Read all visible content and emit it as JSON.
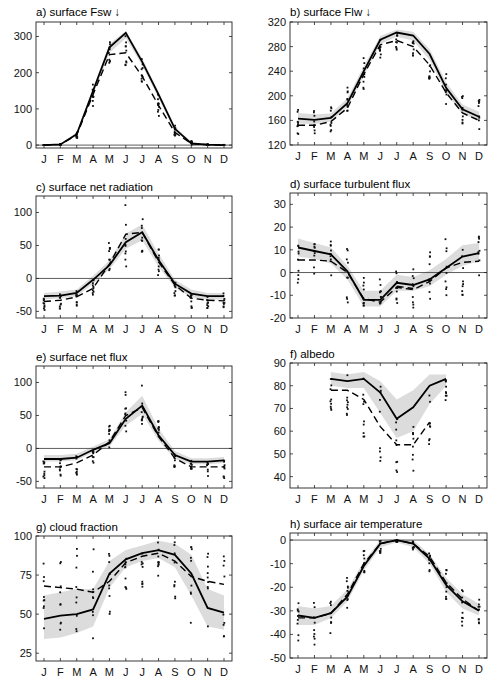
{
  "months": [
    "J",
    "F",
    "M",
    "A",
    "M",
    "J",
    "J",
    "A",
    "S",
    "O",
    "N",
    "D"
  ],
  "chart_data": [
    {
      "id": "a",
      "type": "line",
      "title": "a) surface Fsw ↓",
      "frame": [
        36,
        22,
        232,
        148
      ],
      "ylim": [
        -8,
        340
      ],
      "yticks": [
        0,
        100,
        200,
        300
      ],
      "zero_line": false,
      "series": [
        {
          "name": "solid",
          "style": "solid",
          "values": [
            0,
            2,
            30,
            150,
            270,
            310,
            230,
            140,
            45,
            5,
            1,
            0
          ]
        },
        {
          "name": "dashed",
          "style": "dashed",
          "values": [
            0,
            2,
            28,
            140,
            250,
            255,
            190,
            110,
            35,
            4,
            1,
            0
          ]
        }
      ],
      "band": {
        "lower": [
          0,
          1,
          25,
          140,
          255,
          295,
          220,
          130,
          38,
          3,
          0,
          0
        ],
        "upper": [
          1,
          4,
          35,
          158,
          280,
          315,
          240,
          148,
          52,
          8,
          2,
          1
        ]
      },
      "scatter_spread": [
        [
          0,
          0
        ],
        [
          0,
          3
        ],
        [
          18,
          40
        ],
        [
          105,
          170
        ],
        [
          210,
          290
        ],
        [
          220,
          310
        ],
        [
          170,
          250
        ],
        [
          80,
          155
        ],
        [
          25,
          65
        ],
        [
          0,
          12
        ],
        [
          0,
          2
        ],
        [
          0,
          1
        ]
      ]
    },
    {
      "id": "b",
      "type": "line",
      "title": "b) surface Flw ↓",
      "frame": [
        290,
        22,
        487,
        145
      ],
      "ylim": [
        120,
        320
      ],
      "yticks": [
        120,
        160,
        200,
        240,
        280,
        320
      ],
      "zero_line": false,
      "series": [
        {
          "name": "solid",
          "style": "solid",
          "values": [
            163,
            161,
            164,
            188,
            240,
            291,
            303,
            298,
            268,
            213,
            178,
            166
          ]
        },
        {
          "name": "dashed",
          "style": "dashed",
          "values": [
            152,
            152,
            158,
            180,
            235,
            283,
            290,
            280,
            250,
            205,
            172,
            160
          ]
        }
      ],
      "band": {
        "lower": [
          155,
          154,
          158,
          182,
          232,
          284,
          296,
          290,
          258,
          205,
          170,
          160
        ],
        "upper": [
          172,
          170,
          171,
          196,
          248,
          297,
          308,
          304,
          276,
          222,
          186,
          174
        ]
      },
      "scatter_spread": [
        [
          135,
          182
        ],
        [
          133,
          180
        ],
        [
          138,
          185
        ],
        [
          170,
          215
        ],
        [
          208,
          268
        ],
        [
          250,
          300
        ],
        [
          275,
          302
        ],
        [
          265,
          300
        ],
        [
          225,
          272
        ],
        [
          180,
          242
        ],
        [
          155,
          212
        ],
        [
          145,
          195
        ]
      ]
    },
    {
      "id": "c",
      "type": "line",
      "title": "c) surface net radiation",
      "frame": [
        36,
        196,
        232,
        318
      ],
      "ylim": [
        -60,
        125
      ],
      "yticks": [
        -50,
        0,
        50,
        100
      ],
      "zero_line": true,
      "series": [
        {
          "name": "solid",
          "style": "solid",
          "values": [
            -27,
            -26,
            -22,
            -2,
            20,
            55,
            70,
            28,
            -8,
            -23,
            -27,
            -27
          ]
        },
        {
          "name": "dashed",
          "style": "dashed",
          "values": [
            -35,
            -33,
            -28,
            -15,
            22,
            67,
            70,
            25,
            -10,
            -30,
            -33,
            -34
          ]
        }
      ],
      "band": {
        "lower": [
          -32,
          -30,
          -27,
          -8,
          14,
          45,
          58,
          18,
          -14,
          -29,
          -32,
          -32
        ],
        "upper": [
          -22,
          -20,
          -17,
          4,
          27,
          68,
          82,
          38,
          -2,
          -17,
          -22,
          -22
        ]
      },
      "scatter_spread": [
        [
          -48,
          -20
        ],
        [
          -46,
          -20
        ],
        [
          -42,
          -18
        ],
        [
          -28,
          -2
        ],
        [
          -8,
          57
        ],
        [
          14,
          112
        ],
        [
          36,
          100
        ],
        [
          2,
          48
        ],
        [
          -28,
          -6
        ],
        [
          -48,
          -20
        ],
        [
          -48,
          -22
        ],
        [
          -48,
          -22
        ]
      ]
    },
    {
      "id": "d",
      "type": "line",
      "title": "d) surface turbulent flux",
      "frame": [
        290,
        193,
        487,
        318
      ],
      "ylim": [
        -20,
        35
      ],
      "yticks": [
        -20,
        -10,
        0,
        10,
        20,
        30
      ],
      "zero_line": true,
      "series": [
        {
          "name": "solid",
          "style": "solid",
          "values": [
            11,
            9.5,
            8,
            0.5,
            -12,
            -12,
            -4.5,
            -5.5,
            -3,
            2,
            7,
            8.5
          ]
        },
        {
          "name": "dashed",
          "style": "dashed",
          "values": [
            5.5,
            5.5,
            5,
            0,
            -11.5,
            -13,
            -6.5,
            -7.5,
            -4,
            2,
            4.5,
            5
          ]
        },
        {
          "name": "dashed2",
          "style": "dashed",
          "values": [
            null,
            null,
            null,
            null,
            null,
            null,
            -6,
            -7,
            null,
            null,
            null,
            null
          ]
        }
      ],
      "band": {
        "lower": [
          7,
          6,
          4,
          -3,
          -15,
          -15,
          -8,
          -8,
          -6,
          -1,
          3,
          5
        ],
        "upper": [
          15,
          13,
          11,
          3,
          -8,
          -8,
          -1,
          -2,
          1,
          6,
          12,
          13
        ]
      },
      "scatter_spread": [
        [
          -5,
          16
        ],
        [
          -3,
          15
        ],
        [
          -3,
          15
        ],
        [
          -14,
          11
        ],
        [
          -20,
          3
        ],
        [
          -14,
          -2
        ],
        [
          -15,
          1
        ],
        [
          -16,
          5
        ],
        [
          -14,
          10
        ],
        [
          -14,
          15
        ],
        [
          -10,
          16
        ],
        [
          -7,
          16
        ]
      ]
    },
    {
      "id": "e",
      "type": "line",
      "title": "e) surface net flux",
      "frame": [
        36,
        366,
        232,
        488
      ],
      "ylim": [
        -60,
        125
      ],
      "yticks": [
        -50,
        0,
        50,
        100
      ],
      "zero_line": true,
      "series": [
        {
          "name": "solid",
          "style": "solid",
          "values": [
            -16,
            -16,
            -14,
            -2,
            8,
            45,
            65,
            20,
            -10,
            -20,
            -20,
            -18
          ]
        },
        {
          "name": "dashed",
          "style": "dashed",
          "values": [
            -28,
            -28,
            -22,
            -10,
            10,
            50,
            62,
            18,
            -15,
            -28,
            -28,
            -28
          ]
        }
      ],
      "band": {
        "lower": [
          -20,
          -20,
          -18,
          -6,
          3,
          35,
          52,
          12,
          -16,
          -24,
          -24,
          -22
        ],
        "upper": [
          -10,
          -10,
          -8,
          3,
          14,
          55,
          80,
          30,
          -4,
          -15,
          -15,
          -13
        ]
      },
      "scatter_spread": [
        [
          -46,
          -15
        ],
        [
          -44,
          -15
        ],
        [
          -40,
          -10
        ],
        [
          -22,
          -4
        ],
        [
          -4,
          37
        ],
        [
          12,
          94
        ],
        [
          36,
          97
        ],
        [
          8,
          42
        ],
        [
          -30,
          -6
        ],
        [
          -42,
          -18
        ],
        [
          -44,
          -18
        ],
        [
          -46,
          -18
        ]
      ]
    },
    {
      "id": "f",
      "type": "line",
      "title": "f) albedo",
      "frame": [
        290,
        363,
        487,
        488
      ],
      "ylim": [
        35,
        90
      ],
      "yticks": [
        40,
        50,
        60,
        70,
        80,
        90
      ],
      "zero_line": false,
      "series": [
        {
          "name": "solid",
          "style": "solid",
          "values": [
            null,
            null,
            83,
            82,
            83,
            77,
            65.5,
            70.5,
            80,
            83,
            null,
            null
          ]
        },
        {
          "name": "dashed",
          "style": "dashed",
          "values": [
            null,
            null,
            78,
            78,
            74,
            62,
            54,
            54,
            64,
            null,
            null,
            null
          ]
        }
      ],
      "band": {
        "lower": [
          null,
          null,
          80,
          79,
          79,
          68,
          57,
          60,
          72,
          80,
          null,
          null
        ],
        "upper": [
          null,
          null,
          86,
          85,
          86,
          82,
          74,
          78,
          85,
          85,
          null,
          null
        ]
      },
      "scatter_spread": [
        [
          null,
          null
        ],
        [
          null,
          null
        ],
        [
          69,
          85
        ],
        [
          67,
          85
        ],
        [
          56,
          84
        ],
        [
          46,
          80
        ],
        [
          42,
          66
        ],
        [
          41,
          66
        ],
        [
          54,
          76
        ],
        [
          73,
          83
        ],
        [
          null,
          null
        ],
        [
          null,
          null
        ]
      ]
    },
    {
      "id": "g",
      "type": "line",
      "title": "g) cloud fraction",
      "frame": [
        36,
        536,
        232,
        661
      ],
      "ylim": [
        20,
        100
      ],
      "yticks": [
        25,
        50,
        75,
        100
      ],
      "zero_line": false,
      "series": [
        {
          "name": "solid",
          "style": "solid",
          "values": [
            47,
            49,
            50,
            53,
            76,
            85,
            89,
            91,
            88,
            76,
            54,
            51
          ]
        },
        {
          "name": "dashed",
          "style": "dashed",
          "values": [
            68,
            67,
            66,
            64,
            71,
            83,
            87,
            89,
            84,
            74,
            71,
            69
          ]
        }
      ],
      "band": {
        "lower": [
          34,
          35,
          38,
          42,
          67,
          80,
          84,
          86,
          80,
          62,
          42,
          40
        ],
        "upper": [
          62,
          64,
          66,
          66,
          84,
          91,
          94,
          97,
          95,
          88,
          66,
          62
        ]
      },
      "scatter_spread": [
        [
          34,
          94
        ],
        [
          35,
          94
        ],
        [
          32,
          93
        ],
        [
          27,
          92
        ],
        [
          45,
          89
        ],
        [
          62,
          95
        ],
        [
          66,
          93
        ],
        [
          71,
          96
        ],
        [
          59,
          97
        ],
        [
          42,
          95
        ],
        [
          35,
          94
        ],
        [
          33,
          95
        ]
      ]
    },
    {
      "id": "h",
      "type": "line",
      "title": "h) surface air temperature",
      "frame": [
        290,
        533,
        487,
        658
      ],
      "ylim": [
        -50,
        3
      ],
      "yticks": [
        -50,
        -40,
        -30,
        -20,
        -10,
        0
      ],
      "zero_line": true,
      "series": [
        {
          "name": "solid",
          "style": "solid",
          "values": [
            -32,
            -33,
            -31,
            -24,
            -11,
            -1.5,
            0,
            -1.5,
            -8,
            -19,
            -26,
            -30
          ]
        },
        {
          "name": "dashed",
          "style": "dashed",
          "values": [
            -33,
            -33,
            -31,
            -23,
            -10,
            -1.5,
            0,
            -1.5,
            -7,
            -18,
            -25,
            -30
          ]
        }
      ],
      "band": {
        "lower": [
          -36,
          -36,
          -33,
          -26,
          -13,
          -3,
          -1,
          -3,
          -10,
          -22,
          -29,
          -32
        ],
        "upper": [
          -28,
          -29,
          -28,
          -21,
          -9,
          0,
          0.5,
          0,
          -6,
          -16,
          -23,
          -27
        ]
      },
      "scatter_spread": [
        [
          -45,
          -25
        ],
        [
          -45,
          -25
        ],
        [
          -41,
          -24
        ],
        [
          -29,
          -16
        ],
        [
          -15,
          -3
        ],
        [
          -6,
          0
        ],
        [
          -1,
          0
        ],
        [
          -4,
          0
        ],
        [
          -14,
          -5
        ],
        [
          -28,
          -12
        ],
        [
          -37,
          -18
        ],
        [
          -41,
          -22
        ]
      ]
    }
  ],
  "footer_partial_labels": [
    "J",
    "A",
    "S",
    "O",
    "N",
    "D"
  ]
}
